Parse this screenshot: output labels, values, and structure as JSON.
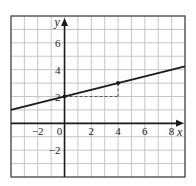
{
  "chart_data": {
    "type": "line",
    "title": "",
    "xlabel": "x",
    "ylabel": "y",
    "xlim": [
      -4,
      9
    ],
    "ylim": [
      -4,
      8
    ],
    "grid": true,
    "grid_step": 1,
    "x_ticks": [
      {
        "value": -2,
        "label": "−2"
      },
      {
        "value": 0,
        "label": "0"
      },
      {
        "value": 2,
        "label": "2"
      },
      {
        "value": 4,
        "label": "4"
      },
      {
        "value": 6,
        "label": "6"
      },
      {
        "value": 8,
        "label": "8"
      }
    ],
    "y_ticks": [
      {
        "value": 6,
        "label": "6"
      },
      {
        "value": 4,
        "label": "4"
      },
      {
        "value": 2,
        "label": "2"
      },
      {
        "value": -2,
        "label": "−2"
      }
    ],
    "series": [
      {
        "name": "line",
        "equation": "y = 0.25x + 2",
        "slope": 0.25,
        "intercept": 2,
        "x": [
          -4,
          9
        ],
        "y": [
          1,
          4.25
        ]
      }
    ],
    "points": [
      {
        "x": 0,
        "y": 2
      },
      {
        "x": 4,
        "y": 3
      }
    ],
    "annotations": [
      {
        "type": "dashed-segment",
        "from": [
          0,
          2
        ],
        "to": [
          4,
          2
        ]
      },
      {
        "type": "dashed-segment",
        "from": [
          4,
          2
        ],
        "to": [
          4,
          3
        ]
      }
    ],
    "colors": {
      "grid": "#b8b8b8",
      "axis": "#1a1a1a",
      "line": "#1a1a1a",
      "frame": "#444444"
    }
  }
}
